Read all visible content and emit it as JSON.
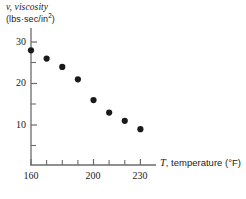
{
  "chart_data": {
    "type": "scatter",
    "title": "",
    "xlabel": "T, temperature (°F)",
    "ylabel": "v, viscosity (lbs·sec/in²)",
    "ylabel_line1": "v, viscosity",
    "ylabel_line2": "(lbs·sec/in",
    "ylabel_exponent": "2",
    "ylabel_line2_close": ")",
    "xlabel_var": "T",
    "xlabel_rest": ", temperature (°F)",
    "x": [
      160,
      170,
      180,
      190,
      200,
      210,
      220,
      230
    ],
    "values": [
      28,
      26,
      24,
      21,
      16,
      13,
      11,
      9
    ],
    "xlim": [
      160,
      240
    ],
    "ylim": [
      0,
      32
    ],
    "xticks": [
      160,
      170,
      180,
      190,
      200,
      210,
      220,
      230
    ],
    "xtick_labels": [
      "160",
      "200",
      "230"
    ],
    "xtick_labeled_values": [
      160,
      200,
      230
    ],
    "yticks": [
      5,
      10,
      15,
      20,
      25,
      30
    ],
    "ytick_labels": [
      "30",
      "20",
      "10"
    ],
    "ytick_labeled_values": [
      30,
      20,
      10
    ],
    "grid": false,
    "legend": null,
    "marker": "filled-circle",
    "marker_color": "#1a1a1a"
  },
  "axis": {
    "line_color": "#6b6b6b"
  }
}
